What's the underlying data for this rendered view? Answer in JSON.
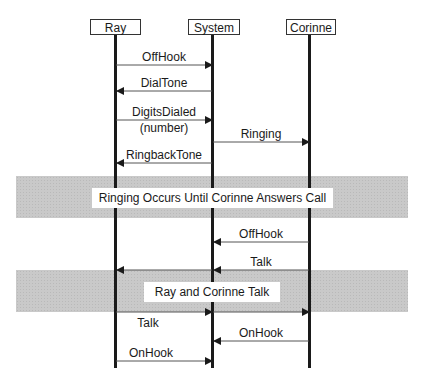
{
  "actors": [
    {
      "id": "ray",
      "label": "Ray"
    },
    {
      "id": "system",
      "label": "System"
    },
    {
      "id": "corinne",
      "label": "Corinne"
    }
  ],
  "messages": [
    {
      "label": "OffHook",
      "from": "ray",
      "to": "system"
    },
    {
      "label": "DialTone",
      "from": "system",
      "to": "ray"
    },
    {
      "label": "DigitsDialed",
      "sublabel": "(number)",
      "from": "ray",
      "to": "system"
    },
    {
      "label": "Ringing",
      "from": "system",
      "to": "corinne"
    },
    {
      "label": "RingbackTone",
      "from": "system",
      "to": "ray"
    },
    {
      "label": "OffHook",
      "from": "corinne",
      "to": "system"
    },
    {
      "label": "Talk",
      "from": "corinne",
      "to": "ray",
      "via": "system"
    },
    {
      "label": "Talk",
      "from": "ray",
      "to": "corinne",
      "via": "system"
    },
    {
      "label": "OnHook",
      "from": "corinne",
      "to": "system"
    },
    {
      "label": "OnHook",
      "from": "ray",
      "to": "system"
    }
  ],
  "bands": [
    {
      "label": "Ringing Occurs Until Corinne Answers Call"
    },
    {
      "label": "Ray and Corinne Talk"
    }
  ]
}
